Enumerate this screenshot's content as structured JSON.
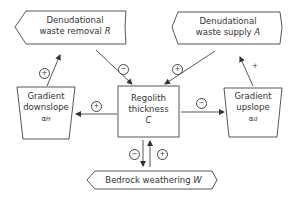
{
  "nodes": {
    "removal": {
      "line1": "Denudational",
      "line2": "waste removal",
      "symbol": "R"
    },
    "supply": {
      "line1": "Denudational",
      "line2": "waste supply",
      "symbol": "A"
    },
    "downslope": {
      "line1": "Gradient",
      "line2": "downslope",
      "symbol": "α",
      "sub": "H"
    },
    "regolith": {
      "line1": "Regolith",
      "line2": "thickness",
      "symbol": "C"
    },
    "upslope": {
      "line1": "Gradient",
      "line2": "upslope",
      "symbol": "α",
      "sub": "d"
    },
    "bedrock": {
      "line1": "Bedrock weathering",
      "symbol": "W"
    }
  },
  "links": [
    {
      "from": "downslope",
      "to": "removal",
      "sign": "+"
    },
    {
      "from": "removal",
      "to": "regolith",
      "sign": "−"
    },
    {
      "from": "supply",
      "to": "regolith",
      "sign": "+"
    },
    {
      "from": "upslope",
      "to": "supply",
      "sign": "+"
    },
    {
      "from": "regolith",
      "to": "downslope",
      "sign": "+"
    },
    {
      "from": "regolith",
      "to": "upslope",
      "sign": "−"
    },
    {
      "from": "regolith",
      "to": "bedrock",
      "sign": "−"
    },
    {
      "from": "bedrock",
      "to": "regolith",
      "sign": "+"
    }
  ]
}
